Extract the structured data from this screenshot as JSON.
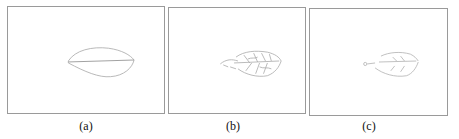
{
  "figure": {
    "panels": [
      {
        "id": "a",
        "caption": "(a)",
        "description": "Leaf contour outline with midrib"
      },
      {
        "id": "b",
        "caption": "(b)",
        "description": "Leaf edge detection with venation detail"
      },
      {
        "id": "c",
        "caption": "(c)",
        "description": "Sparse leaf edge detection result"
      }
    ]
  },
  "colors": {
    "frame": "#9a9a9a",
    "stroke": "#a8a8a8",
    "background": "#ffffff"
  }
}
